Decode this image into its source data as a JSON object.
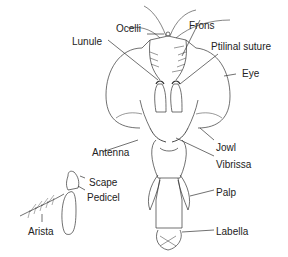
{
  "diagram": {
    "labels": {
      "ocelli": "Ocelli",
      "frons": "Frons",
      "lunule": "Lunule",
      "ptilinal_suture": "Ptilinal suture",
      "eye": "Eye",
      "antenna": "Antenna",
      "jowl": "Jowl",
      "vibrissa": "Vibrissa",
      "scape": "Scape",
      "pedicel": "Pedicel",
      "palp": "Palp",
      "arista": "Arista",
      "labella": "Labella"
    },
    "colors": {
      "line": "#333333",
      "text": "#222222",
      "background": "#ffffff"
    }
  }
}
